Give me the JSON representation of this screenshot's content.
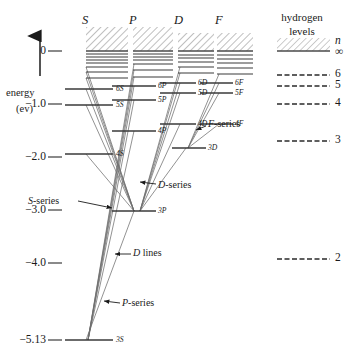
{
  "axis": {
    "label_line1": "energy",
    "label_line2": "(ev)",
    "arrow_icon": "up-arrow-icon",
    "ticks": [
      {
        "value": 0,
        "label": "0",
        "y": 51
      },
      {
        "value": -1.0,
        "label": "−1.0",
        "y": 104
      },
      {
        "value": -2.0,
        "label": "−2.0",
        "y": 157
      },
      {
        "value": -3.0,
        "label": "−3.0",
        "y": 210
      },
      {
        "value": -4.0,
        "label": "−4.0",
        "y": 263
      },
      {
        "value": -5.13,
        "label": "−5.13",
        "y": 340
      }
    ],
    "unit": "ev",
    "min": -5.13,
    "max": 0
  },
  "columns": [
    {
      "id": "S",
      "header": "S",
      "x": 86,
      "header_x": 82,
      "width": 42
    },
    {
      "id": "P",
      "header": "P",
      "x": 133,
      "header_x": 129,
      "width": 40
    },
    {
      "id": "D",
      "header": "D",
      "x": 178,
      "header_x": 174,
      "width": 36
    },
    {
      "id": "F",
      "header": "F",
      "x": 217,
      "header_x": 215,
      "width": 36
    }
  ],
  "columns_header_y": 14,
  "continuum": [
    {
      "col": "S",
      "x": 86,
      "w": 42,
      "top": 27,
      "bottom": 51
    },
    {
      "col": "P",
      "x": 133,
      "w": 40,
      "top": 27,
      "bottom": 51
    },
    {
      "col": "D",
      "x": 178,
      "w": 36,
      "top": 33,
      "bottom": 51
    },
    {
      "col": "F",
      "x": 217,
      "w": 36,
      "top": 33,
      "bottom": 51
    }
  ],
  "levels": {
    "S": [
      {
        "label": "",
        "energy": -0.05,
        "y": 54,
        "x1": 86,
        "x2": 128,
        "show_label": false
      },
      {
        "label": "",
        "energy": -0.1,
        "y": 57,
        "x1": 86,
        "x2": 128,
        "show_label": false
      },
      {
        "label": "",
        "energy": -0.16,
        "y": 60,
        "x1": 86,
        "x2": 128,
        "show_label": false
      },
      {
        "label": "",
        "energy": -0.23,
        "y": 63,
        "x1": 86,
        "x2": 128,
        "show_label": false
      },
      {
        "label": "",
        "energy": -0.32,
        "y": 67,
        "x1": 86,
        "x2": 128,
        "show_label": false
      },
      {
        "label": "",
        "energy": -0.43,
        "y": 72,
        "x1": 86,
        "x2": 128,
        "show_label": false
      },
      {
        "label": "",
        "energy": -0.55,
        "y": 78,
        "x1": 86,
        "x2": 128,
        "show_label": false
      },
      {
        "label": "6S",
        "energy": -0.72,
        "y": 89,
        "x1": 65,
        "x2": 113,
        "show_label": true,
        "label_x": 116
      },
      {
        "label": "5S",
        "energy": -1.02,
        "y": 105,
        "x1": 65,
        "x2": 113,
        "show_label": true,
        "label_x": 116
      },
      {
        "label": "4S",
        "energy": -1.94,
        "y": 154,
        "x1": 65,
        "x2": 113,
        "show_label": true,
        "label_x": 116
      },
      {
        "label": "3S",
        "energy": -5.13,
        "y": 340,
        "x1": 65,
        "x2": 113,
        "show_label": true,
        "label_x": 116
      }
    ],
    "P": [
      {
        "label": "",
        "energy": -0.05,
        "y": 54,
        "x1": 133,
        "x2": 173,
        "show_label": false
      },
      {
        "label": "",
        "energy": -0.11,
        "y": 57,
        "x1": 133,
        "x2": 173,
        "show_label": false
      },
      {
        "label": "",
        "energy": -0.17,
        "y": 60,
        "x1": 133,
        "x2": 173,
        "show_label": false
      },
      {
        "label": "",
        "energy": -0.25,
        "y": 64,
        "x1": 133,
        "x2": 173,
        "show_label": false
      },
      {
        "label": "",
        "energy": -0.36,
        "y": 70,
        "x1": 133,
        "x2": 173,
        "show_label": false
      },
      {
        "label": "",
        "energy": -0.49,
        "y": 77,
        "x1": 133,
        "x2": 173,
        "show_label": false
      },
      {
        "label": "6P",
        "energy": -0.66,
        "y": 86,
        "x1": 112,
        "x2": 156,
        "show_label": true,
        "label_x": 158
      },
      {
        "label": "5P",
        "energy": -0.93,
        "y": 100,
        "x1": 112,
        "x2": 156,
        "show_label": true,
        "label_x": 158
      },
      {
        "label": "4P",
        "energy": -1.51,
        "y": 131,
        "x1": 112,
        "x2": 156,
        "show_label": true,
        "label_x": 158
      },
      {
        "label": "3P",
        "energy": -3.03,
        "y": 211,
        "x1": 112,
        "x2": 156,
        "show_label": true,
        "label_x": 158
      }
    ],
    "D": [
      {
        "label": "",
        "energy": -0.06,
        "y": 55,
        "x1": 178,
        "x2": 214,
        "show_label": false
      },
      {
        "label": "",
        "energy": -0.13,
        "y": 58,
        "x1": 178,
        "x2": 214,
        "show_label": false
      },
      {
        "label": "",
        "energy": -0.21,
        "y": 62,
        "x1": 178,
        "x2": 214,
        "show_label": false
      },
      {
        "label": "",
        "energy": -0.3,
        "y": 67,
        "x1": 178,
        "x2": 214,
        "show_label": false
      },
      {
        "label": "",
        "energy": -0.42,
        "y": 73,
        "x1": 178,
        "x2": 214,
        "show_label": false
      },
      {
        "label": "6D",
        "energy": -0.61,
        "y": 83,
        "x1": 160,
        "x2": 196,
        "show_label": true,
        "label_x": 198
      },
      {
        "label": "5D",
        "energy": -0.87,
        "y": 93,
        "x1": 160,
        "x2": 196,
        "show_label": true,
        "label_x": 198
      },
      {
        "label": "4D",
        "energy": -1.38,
        "y": 124,
        "x1": 160,
        "x2": 196,
        "show_label": true,
        "label_x": 198
      },
      {
        "label": "3D",
        "energy": -2.49,
        "y": 148,
        "x1": 172,
        "x2": 206,
        "show_label": true,
        "label_x": 208
      }
    ],
    "F": [
      {
        "label": "",
        "energy": -0.07,
        "y": 55,
        "x1": 217,
        "x2": 253,
        "show_label": false
      },
      {
        "label": "",
        "energy": -0.14,
        "y": 59,
        "x1": 217,
        "x2": 253,
        "show_label": false
      },
      {
        "label": "",
        "energy": -0.22,
        "y": 63,
        "x1": 217,
        "x2": 253,
        "show_label": false
      },
      {
        "label": "",
        "energy": -0.32,
        "y": 68,
        "x1": 217,
        "x2": 253,
        "show_label": false
      },
      {
        "label": "",
        "energy": -0.44,
        "y": 74,
        "x1": 217,
        "x2": 253,
        "show_label": false
      },
      {
        "label": "6F",
        "energy": -0.61,
        "y": 83,
        "x1": 200,
        "x2": 233,
        "show_label": true,
        "label_x": 235
      },
      {
        "label": "5F",
        "energy": -0.87,
        "y": 93,
        "x1": 200,
        "x2": 233,
        "show_label": true,
        "label_x": 235
      },
      {
        "label": "4F",
        "energy": -1.38,
        "y": 124,
        "x1": 200,
        "x2": 233,
        "show_label": true,
        "label_x": 235
      }
    ]
  },
  "annotations": [
    {
      "id": "s-series",
      "text": "S-series",
      "x": 28,
      "y": 202,
      "arrow_to_x": 112,
      "arrow_to_y": 208,
      "arrow_from_x": 78,
      "arrow_from_y": 201,
      "italic_prefix": "S",
      "rest": "-series"
    },
    {
      "id": "d-series",
      "text": "D-series",
      "x": 158,
      "y": 186,
      "arrow_to_x": 140,
      "arrow_to_y": 182,
      "arrow_from_x": 156,
      "arrow_from_y": 184,
      "italic_prefix": "D",
      "rest": "-series"
    },
    {
      "id": "f-series",
      "text": "F-series",
      "x": 208,
      "y": 125,
      "arrow_to_x": 196,
      "arrow_to_y": 130,
      "arrow_from_x": 206,
      "arrow_from_y": 126,
      "italic_prefix": "F",
      "rest": "-series"
    },
    {
      "id": "d-lines",
      "text": "D lines",
      "x": 133,
      "y": 254,
      "arrow_to_x": 115,
      "arrow_to_y": 254,
      "arrow_from_x": 131,
      "arrow_from_y": 254,
      "italic_prefix": "D",
      "rest": " lines"
    },
    {
      "id": "p-series",
      "text": "P-series",
      "x": 122,
      "y": 304,
      "arrow_to_x": 104,
      "arrow_to_y": 301,
      "arrow_from_x": 120,
      "arrow_from_y": 303,
      "italic_prefix": "P",
      "rest": "-series"
    }
  ],
  "hydrogen": {
    "title_line1": "hydrogen",
    "title_line2": "levels",
    "title_x": 302,
    "title_y1": 12,
    "title_y2": 26,
    "block_x1": 277,
    "block_x2": 330,
    "continuum_top": 38,
    "continuum_bottom": 51,
    "n_symbol": "n",
    "infinity_symbol": "∞",
    "n_symbol_x": 335,
    "n_symbol_y": 41,
    "infinity_y": 52,
    "levels": [
      {
        "n": "6",
        "y": 75,
        "label_x": 335
      },
      {
        "n": "5",
        "y": 86,
        "label_x": 335
      },
      {
        "n": "4",
        "y": 104,
        "label_x": 335
      },
      {
        "n": "3",
        "y": 141,
        "label_x": 335
      },
      {
        "n": "2",
        "y": 259,
        "label_x": 335
      }
    ]
  },
  "transitions": {
    "s_series": [
      {
        "from": [
          86,
          89
        ],
        "to": [
          134,
          211
        ]
      },
      {
        "from": [
          86,
          105
        ],
        "to": [
          134,
          211
        ]
      },
      {
        "from": [
          86,
          154
        ],
        "to": [
          134,
          211
        ]
      },
      {
        "from": [
          86,
          78
        ],
        "to": [
          134,
          211
        ]
      },
      {
        "from": [
          86,
          72
        ],
        "to": [
          134,
          211
        ]
      },
      {
        "from": [
          86,
          67
        ],
        "to": [
          134,
          211
        ]
      }
    ],
    "p_series": [
      {
        "from": [
          134,
          86
        ],
        "to": [
          88,
          340
        ]
      },
      {
        "from": [
          134,
          100
        ],
        "to": [
          88,
          340
        ]
      },
      {
        "from": [
          134,
          131
        ],
        "to": [
          88,
          340
        ]
      },
      {
        "from": [
          134,
          77
        ],
        "to": [
          88,
          340
        ]
      },
      {
        "from": [
          134,
          70
        ],
        "to": [
          88,
          340
        ]
      },
      {
        "from": [
          134,
          64
        ],
        "to": [
          88,
          340
        ]
      }
    ],
    "d_series": [
      {
        "from": [
          180,
          83
        ],
        "to": [
          140,
          211
        ]
      },
      {
        "from": [
          180,
          93
        ],
        "to": [
          140,
          211
        ]
      },
      {
        "from": [
          180,
          124
        ],
        "to": [
          140,
          211
        ]
      },
      {
        "from": [
          180,
          73
        ],
        "to": [
          140,
          211
        ]
      },
      {
        "from": [
          180,
          67
        ],
        "to": [
          140,
          211
        ]
      },
      {
        "from": [
          186,
          148
        ],
        "to": [
          140,
          211
        ]
      }
    ],
    "f_series": [
      {
        "from": [
          219,
          83
        ],
        "to": [
          188,
          148
        ]
      },
      {
        "from": [
          219,
          93
        ],
        "to": [
          188,
          148
        ]
      },
      {
        "from": [
          219,
          124
        ],
        "to": [
          188,
          148
        ]
      },
      {
        "from": [
          219,
          74
        ],
        "to": [
          188,
          148
        ]
      }
    ],
    "d_lines": [
      {
        "from": [
          134,
          211
        ],
        "to": [
          86,
          340
        ]
      }
    ]
  },
  "colors": {
    "line": "#2a2a2a",
    "level": "#3a3a3a",
    "transition": "#6d6d6d",
    "hatch": "#8a8a8a",
    "text": "#1a1a1a"
  }
}
